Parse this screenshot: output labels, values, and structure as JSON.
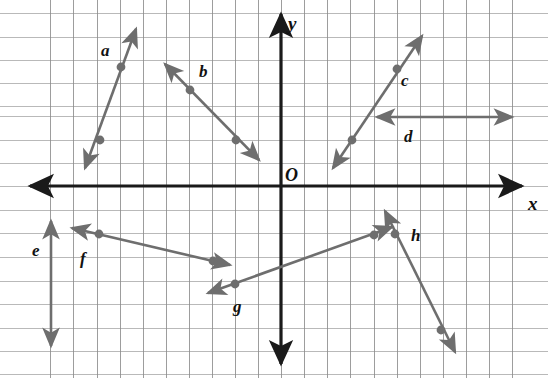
{
  "figure": {
    "type": "geometry-diagram",
    "width": 548,
    "height": 378,
    "background_color": "#ffffff",
    "grid": {
      "visible": true,
      "color": "#8c8c8c",
      "cell_size_px": 23.3,
      "origin_px": {
        "x": 281,
        "y": 186
      },
      "x_lines_px": [
        50,
        73,
        97,
        120,
        143,
        166,
        189,
        212,
        235,
        258,
        281,
        304,
        327,
        350,
        374,
        397,
        420,
        443,
        466,
        489,
        512
      ],
      "y_lines_px": [
        13,
        37,
        60,
        83,
        106,
        116,
        140,
        163,
        186,
        210,
        233,
        257,
        281,
        304,
        328,
        351,
        374
      ]
    },
    "axes": {
      "color": "#1a1a1a",
      "x_axis_label": "x",
      "y_axis_label": "y",
      "origin_label": "O"
    },
    "lines": [
      {
        "id": "a",
        "label": "a",
        "color": "#6e6e6e",
        "orientation": "steep-positive-slope",
        "quadrant": "II",
        "start_px": {
          "x": 85,
          "y": 168
        },
        "end_px": {
          "x": 136,
          "y": 29
        },
        "arrows": "both",
        "points_px": [
          {
            "x": 100,
            "y": 140
          },
          {
            "x": 121,
            "y": 67
          }
        ],
        "label_px": {
          "x": 101,
          "y": 42
        }
      },
      {
        "id": "b",
        "label": "b",
        "color": "#6e6e6e",
        "orientation": "negative-slope",
        "quadrant": "II",
        "start_px": {
          "x": 165,
          "y": 64
        },
        "end_px": {
          "x": 259,
          "y": 160
        },
        "arrows": "both",
        "points_px": [
          {
            "x": 190,
            "y": 90
          },
          {
            "x": 236,
            "y": 140
          }
        ],
        "label_px": {
          "x": 199,
          "y": 63
        }
      },
      {
        "id": "c",
        "label": "c",
        "color": "#6e6e6e",
        "orientation": "positive-slope",
        "quadrant": "I",
        "start_px": {
          "x": 333,
          "y": 168
        },
        "end_px": {
          "x": 422,
          "y": 36
        },
        "arrows": "both",
        "points_px": [
          {
            "x": 352,
            "y": 140
          },
          {
            "x": 397,
            "y": 69
          }
        ],
        "label_px": {
          "x": 401,
          "y": 72
        }
      },
      {
        "id": "d",
        "label": "d",
        "color": "#6e6e6e",
        "orientation": "horizontal",
        "quadrant": "I",
        "start_px": {
          "x": 377,
          "y": 117
        },
        "end_px": {
          "x": 512,
          "y": 117
        },
        "arrows": "both",
        "points_px": [],
        "label_px": {
          "x": 404,
          "y": 128
        }
      },
      {
        "id": "e",
        "label": "e",
        "color": "#6e6e6e",
        "orientation": "vertical",
        "quadrant": "III",
        "start_px": {
          "x": 51,
          "y": 221
        },
        "end_px": {
          "x": 51,
          "y": 346
        },
        "arrows": "both",
        "points_px": [],
        "label_px": {
          "x": 32,
          "y": 242
        }
      },
      {
        "id": "f",
        "label": "f",
        "color": "#6e6e6e",
        "orientation": "shallow-negative-slope",
        "quadrant": "III",
        "start_px": {
          "x": 72,
          "y": 228
        },
        "end_px": {
          "x": 230,
          "y": 265
        },
        "arrows": "both",
        "points_px": [
          {
            "x": 99,
            "y": 234
          },
          {
            "x": 213,
            "y": 261
          }
        ],
        "label_px": {
          "x": 80,
          "y": 250
        }
      },
      {
        "id": "g",
        "label": "g",
        "color": "#6e6e6e",
        "orientation": "shallow-positive-slope",
        "quadrant": "III-IV",
        "start_px": {
          "x": 208,
          "y": 293
        },
        "end_px": {
          "x": 392,
          "y": 227
        },
        "arrows": "both",
        "points_px": [
          {
            "x": 235,
            "y": 284
          },
          {
            "x": 374,
            "y": 235
          }
        ],
        "label_px": {
          "x": 233,
          "y": 298
        }
      },
      {
        "id": "h",
        "label": "h",
        "color": "#6e6e6e",
        "orientation": "steep-negative-slope",
        "quadrant": "IV",
        "start_px": {
          "x": 385,
          "y": 211
        },
        "end_px": {
          "x": 455,
          "y": 352
        },
        "arrows": "both",
        "points_px": [
          {
            "x": 395,
            "y": 234
          },
          {
            "x": 441,
            "y": 330
          }
        ],
        "label_px": {
          "x": 411,
          "y": 227
        }
      }
    ]
  }
}
